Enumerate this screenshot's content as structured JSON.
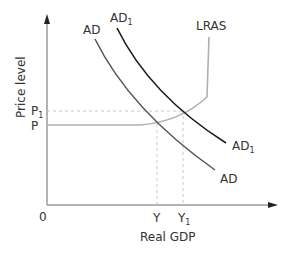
{
  "diagram": {
    "y_axis_label": "Price level",
    "x_axis_label": "Real GDP",
    "origin_label": "0",
    "price_labels": {
      "p": "P",
      "p1_base": "P",
      "p1_sub": "1"
    },
    "output_labels": {
      "y": "Y",
      "y1_base": "Y",
      "y1_sub": "1"
    },
    "curves": {
      "ad_top": "AD",
      "ad_bottom": "AD",
      "ad1_top_base": "AD",
      "ad1_top_sub": "1",
      "ad1_bottom_base": "AD",
      "ad1_bottom_sub": "1",
      "lras": "LRAS"
    },
    "colors": {
      "axis": "#9a9a9a",
      "ad": "#555555",
      "ad1": "#1a1a1a",
      "lras": "#b0b0b0",
      "dashed": "#c8c8c8",
      "text": "#333333"
    }
  }
}
